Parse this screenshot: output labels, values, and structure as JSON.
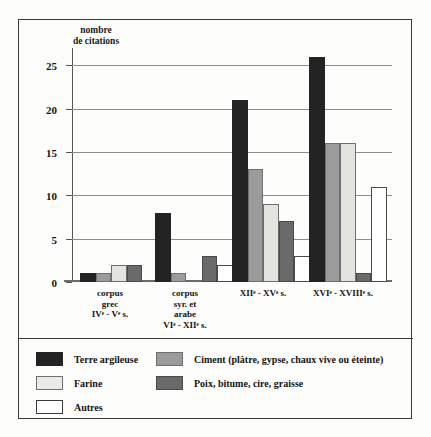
{
  "chart_data": {
    "type": "bar",
    "title": "",
    "subtitle": "",
    "xlabel": "",
    "ylabel": "nombre\nde citations",
    "ylim": [
      0,
      27
    ],
    "yticks": [
      0,
      5,
      10,
      15,
      20,
      25
    ],
    "ytick_labels": [
      "0",
      "5",
      "10",
      "15",
      "20",
      "25"
    ],
    "grid": "horizontal",
    "legend_position": "below-plot",
    "categories": [
      "corpus\ngrec\nIVᵉ - Vᵉ s.",
      "corpus\nsyr. et\narabe\nVIᵉ - XIIᵉ s.",
      "XIIᵉ - XVᵉ s.",
      "XVIᵉ - XVIIIᵉ s."
    ],
    "series": [
      {
        "name": "Terre argileuse",
        "color": "#232323",
        "values": [
          1,
          8,
          21,
          26
        ]
      },
      {
        "name": "Ciment (plâtre, gypse, chaux vive ou éteinte)",
        "color": "#9b9b9b",
        "values": [
          1,
          1,
          13,
          16
        ]
      },
      {
        "name": "Farine",
        "color": "#e3e3e0",
        "values": [
          2,
          0,
          9,
          16
        ]
      },
      {
        "name": "Poix, bitume, cire, graisse",
        "color": "#6a6a6a",
        "values": [
          2,
          3,
          7,
          1
        ]
      },
      {
        "name": "Autres",
        "color": "#ffffff",
        "values": [
          0,
          2,
          3,
          11
        ]
      }
    ]
  },
  "legend": {
    "items": [
      {
        "label": "Terre argileuse"
      },
      {
        "label": "Ciment (plâtre, gypse, chaux vive ou éteinte)"
      },
      {
        "label": "Farine"
      },
      {
        "label": "Poix, bitume, cire, graisse"
      },
      {
        "label": "Autres"
      }
    ]
  }
}
